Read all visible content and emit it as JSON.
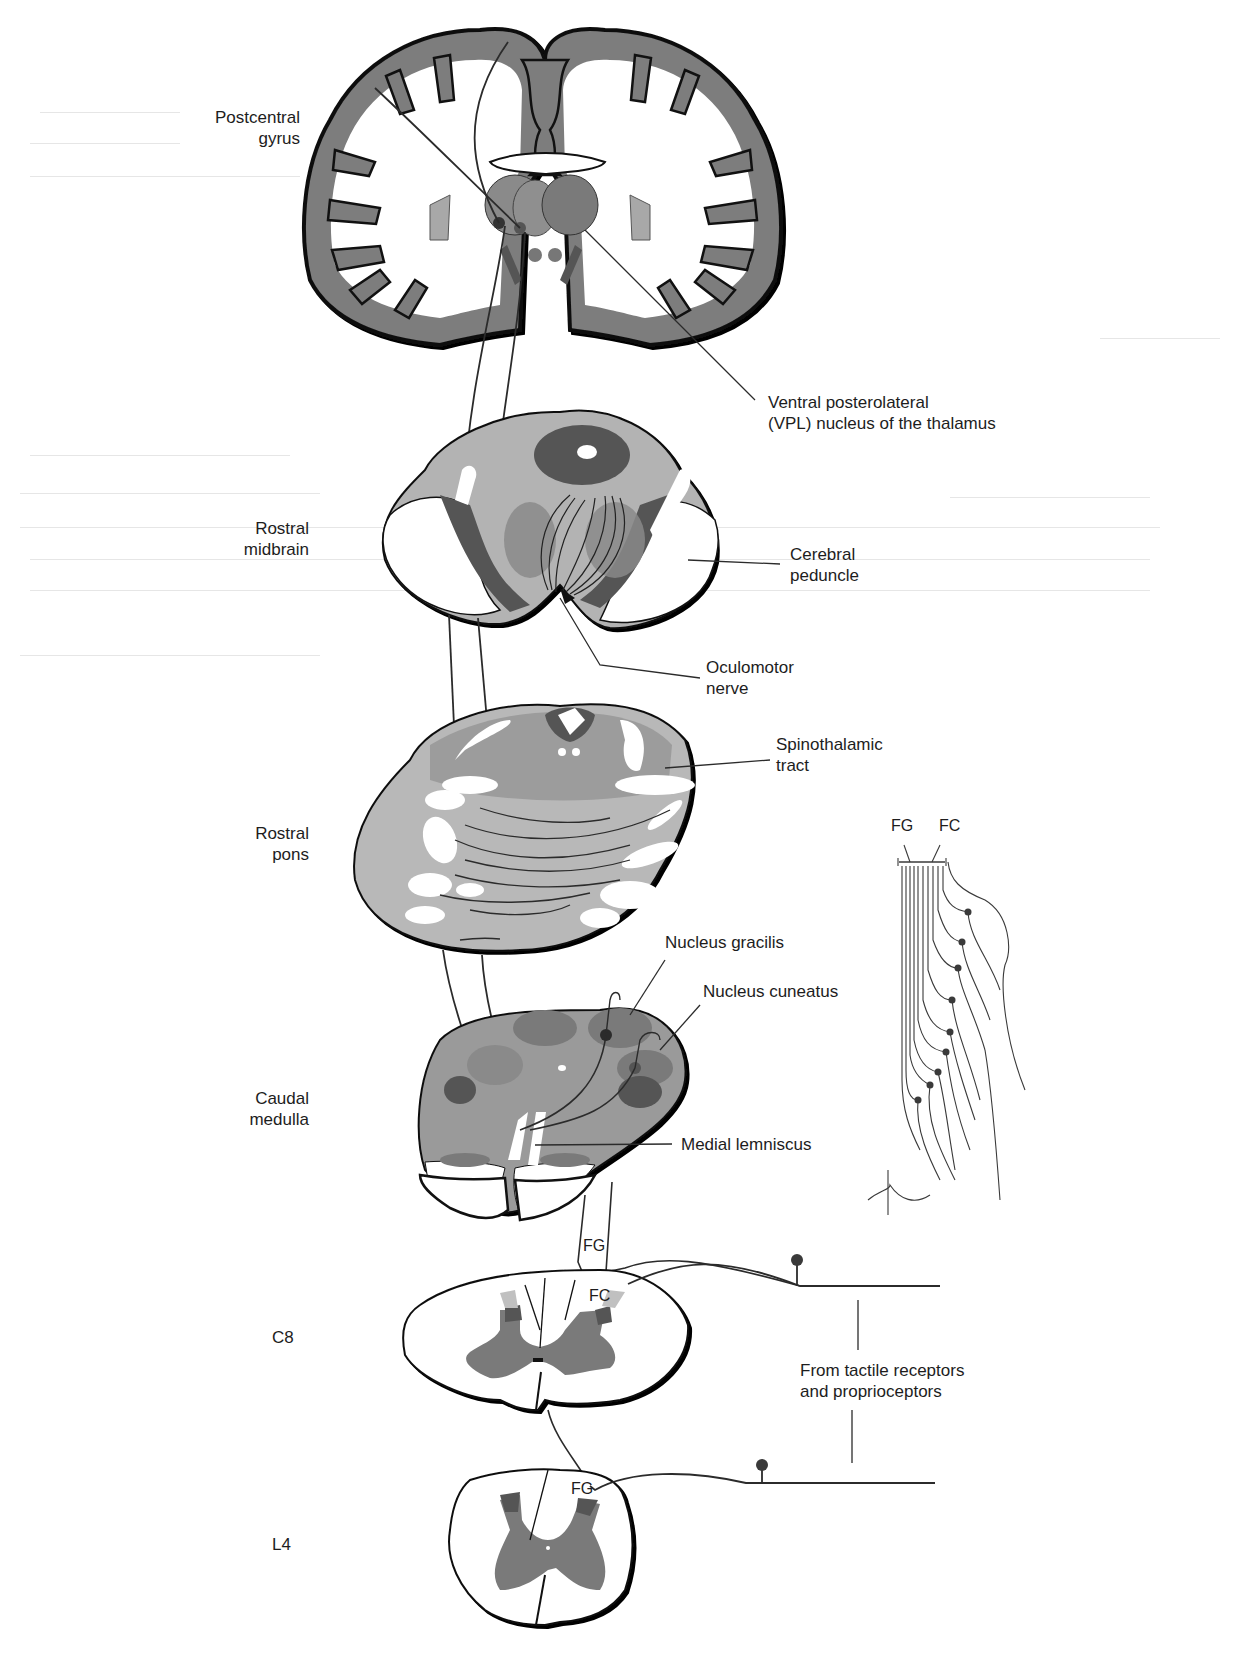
{
  "diagram": {
    "type": "neuroanatomy pathway",
    "colors": {
      "gray_matter": "#7a7a7a",
      "cortex": "#808080",
      "dark_nucleus": "#555555",
      "light_fill": "#b8b8b8",
      "medium_fill": "#9a9a9a",
      "outline": "#111111",
      "tract_line": "#2b2b2b",
      "receptor_dot": "#3a3a3a"
    },
    "section_labels": [
      {
        "id": "postcentral-gyrus",
        "lines": [
          "Postcentral",
          "gyrus"
        ]
      },
      {
        "id": "rostral-midbrain",
        "lines": [
          "Rostral",
          "midbrain"
        ]
      },
      {
        "id": "rostral-pons",
        "lines": [
          "Rostral",
          "pons"
        ]
      },
      {
        "id": "caudal-medulla",
        "lines": [
          "Caudal",
          "medulla"
        ]
      },
      {
        "id": "c8",
        "lines": [
          "C8"
        ]
      },
      {
        "id": "l4",
        "lines": [
          "L4"
        ]
      }
    ],
    "structure_labels": [
      {
        "id": "vpl",
        "lines": [
          "Ventral posterolateral",
          "(VPL) nucleus of the thalamus"
        ]
      },
      {
        "id": "cerebral-peduncle",
        "lines": [
          "Cerebral",
          "peduncle"
        ]
      },
      {
        "id": "oculomotor-nerve",
        "lines": [
          "Oculomotor",
          "nerve"
        ]
      },
      {
        "id": "spinothalamic-tract",
        "lines": [
          "Spinothalamic",
          "tract"
        ]
      },
      {
        "id": "nucleus-gracilis",
        "lines": [
          "Nucleus gracilis"
        ]
      },
      {
        "id": "nucleus-cuneatus",
        "lines": [
          "Nucleus cuneatus"
        ]
      },
      {
        "id": "medial-lemniscus",
        "lines": [
          "Medial lemniscus"
        ]
      },
      {
        "id": "receptors",
        "lines": [
          "From tactile receptors",
          "and proprioceptors"
        ]
      }
    ],
    "inset": {
      "labels": [
        "FG",
        "FC"
      ],
      "description": "Dermatomal body outline with fasciculus gracilis and cuneatus fibers"
    },
    "cord_labels": {
      "c8_fg": "FG",
      "c8_fc": "FC",
      "l4_fg": "FG"
    }
  }
}
